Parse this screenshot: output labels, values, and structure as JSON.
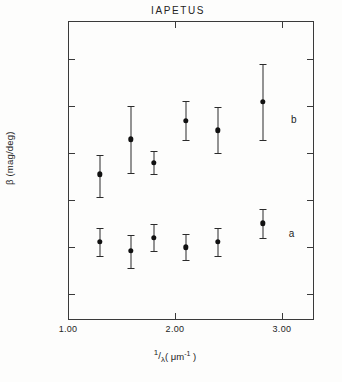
{
  "chart_data": {
    "type": "scatter",
    "title": "IAPETUS",
    "xlabel": "1/λ (μm⁻¹)",
    "ylabel": "β (mag/deg)",
    "xlim": [
      1.0,
      3.3
    ],
    "ylim": [
      0.0145,
      0.0782
    ],
    "grid": false,
    "legend_position": "right-inline",
    "x_ticks": [
      {
        "value": 1.0,
        "label": "1.00"
      },
      {
        "value": 2.0,
        "label": "2.00"
      },
      {
        "value": 3.0,
        "label": "3.00"
      }
    ],
    "y_ticks": [
      {
        "value": 0.07,
        "label": "0.070"
      },
      {
        "value": 0.06,
        "label": "0.060"
      },
      {
        "value": 0.05,
        "label": "0.050"
      },
      {
        "value": 0.04,
        "label": "0.040"
      },
      {
        "value": 0.03,
        "label": "0.030"
      },
      {
        "value": 0.02,
        "label": "0.020"
      }
    ],
    "series": [
      {
        "name": "b",
        "label": "b",
        "label_x": 3.11,
        "label_y": 0.0573,
        "marker": "filled-circle",
        "color": "#111111",
        "points": [
          {
            "x": 1.3,
            "y": 0.0455,
            "yerr_low": 0.0408,
            "yerr_high": 0.0497
          },
          {
            "x": 1.59,
            "y": 0.053,
            "yerr_low": 0.0459,
            "yerr_high": 0.0601
          },
          {
            "x": 1.8,
            "y": 0.048,
            "yerr_low": 0.0456,
            "yerr_high": 0.0506
          },
          {
            "x": 2.1,
            "y": 0.057,
            "yerr_low": 0.0528,
            "yerr_high": 0.0611
          },
          {
            "x": 2.4,
            "y": 0.0549,
            "yerr_low": 0.05,
            "yerr_high": 0.0598
          },
          {
            "x": 2.82,
            "y": 0.061,
            "yerr_low": 0.0529,
            "yerr_high": 0.0691
          }
        ]
      },
      {
        "name": "a",
        "label": "a",
        "label_x": 3.09,
        "label_y": 0.033,
        "marker": "filled-circle",
        "color": "#111111",
        "points": [
          {
            "x": 1.3,
            "y": 0.0311,
            "yerr_low": 0.0282,
            "yerr_high": 0.0341
          },
          {
            "x": 1.59,
            "y": 0.0292,
            "yerr_low": 0.0256,
            "yerr_high": 0.0327
          },
          {
            "x": 1.8,
            "y": 0.032,
            "yerr_low": 0.0292,
            "yerr_high": 0.0349
          },
          {
            "x": 2.1,
            "y": 0.03,
            "yerr_low": 0.0272,
            "yerr_high": 0.0329
          },
          {
            "x": 2.4,
            "y": 0.0311,
            "yerr_low": 0.0282,
            "yerr_high": 0.0341
          },
          {
            "x": 2.82,
            "y": 0.0351,
            "yerr_low": 0.032,
            "yerr_high": 0.0381
          }
        ]
      }
    ]
  },
  "axis_title_parts": {
    "x_numerator": "1",
    "x_denominator": "λ",
    "x_unit_open": "( ",
    "x_unit": "μm",
    "x_unit_exp": "-1",
    "x_unit_close": " )",
    "y_full": "β (mag/deg)"
  }
}
